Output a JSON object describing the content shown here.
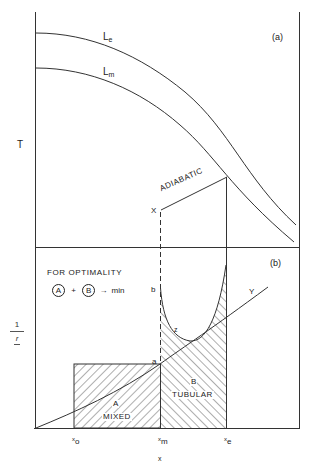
{
  "panel_a": {
    "label": "(a)",
    "y_axis_label": "T",
    "curves": [
      {
        "name": "L",
        "subscript": "e"
      },
      {
        "name": "L",
        "subscript": "m"
      }
    ],
    "adiabatic_label": "ADIABATIC",
    "start_point_label": "X"
  },
  "panel_b": {
    "label": "(b)",
    "y_axis_label_num": "1",
    "y_axis_label_den": "r",
    "note_title": "FOR OPTIMALITY",
    "note_a": "A",
    "note_plus": "+",
    "note_b": "B",
    "note_arrow": "→",
    "note_min": "min",
    "point_a": "a",
    "point_b": "b",
    "curve_z": "z",
    "curve_y": "Y",
    "region_a_letter": "A",
    "region_a_name": "MIXED",
    "region_b_letter": "B",
    "region_b_name": "TUBULAR"
  },
  "x_axis": {
    "label": "x",
    "ticks": [
      {
        "main": "x",
        "sub": "o"
      },
      {
        "main": "x",
        "sub": "m"
      },
      {
        "main": "x",
        "sub": "e"
      }
    ]
  },
  "colors": {
    "ink": "#222222",
    "background": "#ffffff"
  }
}
